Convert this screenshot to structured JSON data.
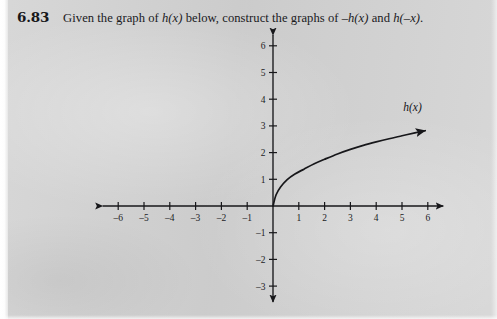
{
  "page": {
    "background_color": "#d3d3d3",
    "ink_color": "#1a1a1d"
  },
  "header": {
    "problem_number": "6.83",
    "text_part1": "Given the graph of ",
    "math1": "h(x)",
    "text_part2": " below, construct the graphs of ",
    "math2": "–h(x)",
    "text_part3": " and ",
    "math3": "h(–x)",
    "text_part4": "."
  },
  "chart_data": {
    "type": "line",
    "title": "",
    "xlabel": "",
    "ylabel": "",
    "xlim": [
      -6.6,
      6.6
    ],
    "ylim": [
      -3.6,
      6.4
    ],
    "grid": false,
    "legend": "none",
    "axis_arrows": [
      "left",
      "right",
      "up",
      "down"
    ],
    "x_ticks": [
      -6,
      -5,
      -4,
      -3,
      -2,
      -1,
      1,
      2,
      3,
      4,
      5,
      6
    ],
    "x_tick_labels": [
      "–6",
      "–5",
      "–4",
      "–3",
      "–2",
      "–1",
      "1",
      "2",
      "3",
      "4",
      "5",
      "6"
    ],
    "y_ticks": [
      6,
      5,
      4,
      3,
      2,
      1,
      -1,
      -2,
      -3
    ],
    "y_tick_labels": [
      "6",
      "5",
      "4",
      "3",
      "2",
      "1",
      "–1",
      "–2",
      "–3"
    ],
    "series": [
      {
        "name": "h(x)",
        "label": "h(x)",
        "label_x": 5.05,
        "label_y": 3.55,
        "arrow_end": true,
        "x": [
          0,
          0.12,
          0.3,
          0.55,
          0.85,
          1.2,
          1.6,
          2.0,
          2.5,
          3.0,
          3.5,
          4.0,
          4.5,
          5.0,
          5.5,
          5.9
        ],
        "y": [
          0,
          0.42,
          0.72,
          0.99,
          1.2,
          1.38,
          1.58,
          1.75,
          1.95,
          2.12,
          2.27,
          2.4,
          2.52,
          2.63,
          2.74,
          2.82
        ]
      }
    ]
  }
}
